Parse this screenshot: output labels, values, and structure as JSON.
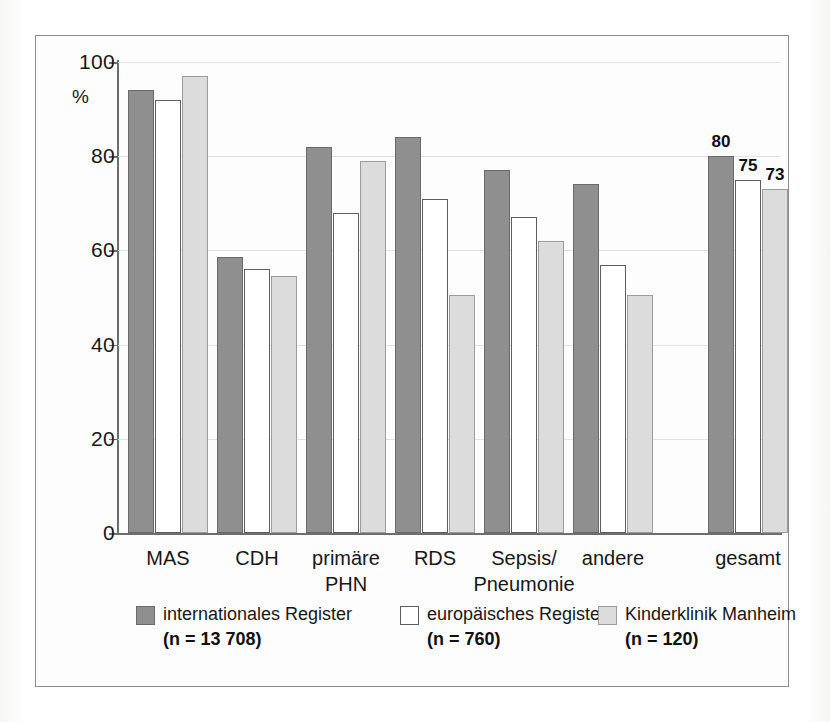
{
  "chart_data": {
    "type": "bar",
    "title": "",
    "xlabel": "",
    "ylabel": "%",
    "ylim": [
      0,
      100
    ],
    "yticks": [
      0,
      20,
      40,
      60,
      80,
      100
    ],
    "ytick_labels": [
      "0",
      "20",
      "40",
      "60",
      "80",
      "100"
    ],
    "grid": true,
    "legend_position": "bottom",
    "categories": [
      "MAS",
      "CDH",
      "primäre\nPHN",
      "RDS",
      "Sepsis/\nPneumonie",
      "andere",
      "gesamt"
    ],
    "series": [
      {
        "name": "internationales Register",
        "n_label": "(n = 13 708)",
        "color": "#8f8f8f",
        "values": [
          94,
          58.5,
          82,
          84,
          77,
          74,
          80
        ],
        "labels": [
          "",
          "",
          "",
          "",
          "",
          "",
          "80"
        ]
      },
      {
        "name": "europäisches Register",
        "n_label": "(n = 760)",
        "color": "#ffffff",
        "values": [
          92,
          56,
          68,
          71,
          67,
          57,
          75
        ],
        "labels": [
          "",
          "",
          "",
          "",
          "",
          "",
          "75"
        ]
      },
      {
        "name": "Kinderklinik Manheim",
        "n_label": "(n = 120)",
        "color": "#dcdcdc",
        "values": [
          97,
          54.5,
          79,
          50.5,
          62,
          50.5,
          73
        ],
        "labels": [
          "",
          "",
          "",
          "",
          "",
          "",
          "73"
        ]
      }
    ]
  },
  "axis": {
    "unit_label": "%"
  },
  "legend": {
    "items": [
      {
        "label": "internationales Register",
        "n": "(n = 13 708)"
      },
      {
        "label": "europäisches Register",
        "n": "(n = 760)"
      },
      {
        "label": "Kinderklinik Manheim",
        "n": "(n = 120)"
      }
    ]
  }
}
